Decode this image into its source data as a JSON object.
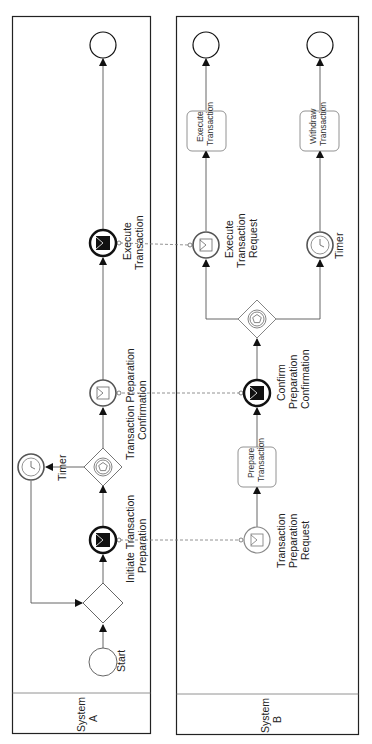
{
  "diagram": {
    "type": "BPMN collaboration",
    "orientation": "rotated-90-ccw",
    "pools": [
      {
        "id": "A",
        "label": "System A",
        "label_lines": [
          "System",
          "A"
        ],
        "elements": [
          {
            "id": "a_start",
            "kind": "start-event",
            "label_lines": [
              "Start"
            ]
          },
          {
            "id": "a_xor",
            "kind": "exclusive-gateway",
            "label_lines": []
          },
          {
            "id": "a_init",
            "kind": "message-throw-event",
            "label_lines": [
              "Initiate Transaction",
              "Preparation"
            ]
          },
          {
            "id": "a_evgw",
            "kind": "event-based-gateway",
            "label_lines": []
          },
          {
            "id": "a_timer",
            "kind": "timer-catch-event",
            "label_lines": [
              "Timer"
            ]
          },
          {
            "id": "a_conf",
            "kind": "message-catch-event",
            "label_lines": [
              "Transaction Preparation",
              "Confirmation"
            ]
          },
          {
            "id": "a_exec",
            "kind": "message-throw-event",
            "label_lines": [
              "Execute",
              "Transaction"
            ]
          },
          {
            "id": "a_end",
            "kind": "end-event",
            "label_lines": []
          }
        ]
      },
      {
        "id": "B",
        "label": "System B",
        "label_lines": [
          "System",
          "B"
        ],
        "elements": [
          {
            "id": "b_req",
            "kind": "message-catch-event",
            "label_lines": [
              "Transaction",
              "Preparation",
              "Request"
            ]
          },
          {
            "id": "b_prep",
            "kind": "task",
            "label_lines": [
              "Prepare",
              "Transaction"
            ]
          },
          {
            "id": "b_conf",
            "kind": "message-throw-event",
            "label_lines": [
              "Confirm",
              "Preparation",
              "Confirmation"
            ]
          },
          {
            "id": "b_evgw",
            "kind": "event-based-gateway",
            "label_lines": []
          },
          {
            "id": "b_execreq",
            "kind": "message-catch-event",
            "label_lines": [
              "Execute",
              "Transaction",
              "Request"
            ]
          },
          {
            "id": "b_timer",
            "kind": "timer-catch-event",
            "label_lines": [
              "Timer"
            ]
          },
          {
            "id": "b_exec",
            "kind": "task",
            "label_lines": [
              "Execute",
              "Transaction"
            ]
          },
          {
            "id": "b_withdraw",
            "kind": "task",
            "label_lines": [
              "Withdraw",
              "Transaction"
            ]
          },
          {
            "id": "b_end1",
            "kind": "end-event",
            "label_lines": []
          },
          {
            "id": "b_end2",
            "kind": "end-event",
            "label_lines": []
          }
        ]
      }
    ],
    "sequence_flows": [
      [
        "a_start",
        "a_xor"
      ],
      [
        "a_xor",
        "a_init"
      ],
      [
        "a_init",
        "a_evgw"
      ],
      [
        "a_evgw",
        "a_timer"
      ],
      [
        "a_timer",
        "a_xor"
      ],
      [
        "a_evgw",
        "a_conf"
      ],
      [
        "a_conf",
        "a_exec"
      ],
      [
        "a_exec",
        "a_end"
      ],
      [
        "b_req",
        "b_prep"
      ],
      [
        "b_prep",
        "b_conf"
      ],
      [
        "b_conf",
        "b_evgw"
      ],
      [
        "b_evgw",
        "b_execreq"
      ],
      [
        "b_evgw",
        "b_timer"
      ],
      [
        "b_execreq",
        "b_exec"
      ],
      [
        "b_exec",
        "b_end1"
      ],
      [
        "b_timer",
        "b_withdraw"
      ],
      [
        "b_withdraw",
        "b_end2"
      ]
    ],
    "message_flows": [
      [
        "a_init",
        "b_req"
      ],
      [
        "b_conf",
        "a_conf"
      ],
      [
        "a_exec",
        "b_execreq"
      ]
    ],
    "colors": {
      "stroke": "#555555",
      "pool_border": "#222222",
      "message_flow": "#777777",
      "throw_fill": "#111111"
    }
  }
}
